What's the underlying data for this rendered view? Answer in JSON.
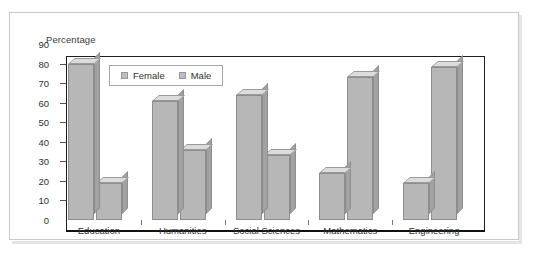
{
  "card": {
    "background": "#ffffff",
    "border_color": "#c9c9c9"
  },
  "chart_data": {
    "type": "bar",
    "title": "",
    "ylabel": "Percentage",
    "xlabel": "",
    "categories": [
      "Education",
      "Humanities",
      "Social Sciences",
      "Mathematics",
      "Engineering"
    ],
    "series": [
      {
        "name": "Female",
        "values": [
          80,
          61,
          64,
          24,
          19
        ],
        "color": "#b7b7b7"
      },
      {
        "name": "Male",
        "values": [
          19,
          36,
          33,
          73,
          78
        ],
        "color": "#b7b7b7"
      }
    ],
    "ylim": [
      0,
      90
    ],
    "ytick_step": 10,
    "yticks": [
      0,
      10,
      20,
      30,
      40,
      50,
      60,
      70,
      80,
      90
    ],
    "ytick_labels": [
      "0",
      "10",
      "20",
      "30",
      "40",
      "50",
      "60",
      "70",
      "80",
      "90"
    ],
    "grid": false,
    "legend_position": "upper-left-inside",
    "bar_style": "3d-extruded",
    "frame_color": "#1d1d1d",
    "baseline_color": "#111111"
  },
  "legend": {
    "items": [
      {
        "label": "Female",
        "swatch_color": "#bdbdbd"
      },
      {
        "label": "Male",
        "swatch_color": "#bdbdbd"
      }
    ]
  }
}
